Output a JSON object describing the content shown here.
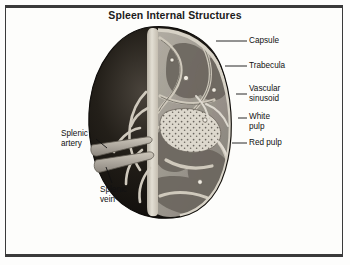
{
  "figure": {
    "title": "Spleen Internal Structures",
    "frame_color": "#3a3a3a",
    "background_color": "#fdfdfb",
    "ink_color": "#111111"
  },
  "labels": {
    "capsule": "Capsule",
    "trabecula": "Trabecula",
    "vascular_sinusoid": "Vascular\nsinusoid",
    "white_pulp": "White\npulp",
    "red_pulp": "Red pulp",
    "splenic_artery": "Splenic\nartery",
    "splenic_vein": "Splenic\nvein"
  },
  "anatomy": {
    "capsule_color": "#cfc9bd",
    "exterior_color": "#15130f",
    "interior_color": "#9a958c",
    "red_pulp_color": "#6f6a62",
    "white_pulp_color": "#e6e2d8",
    "vessel_color": "#b3ada2"
  }
}
